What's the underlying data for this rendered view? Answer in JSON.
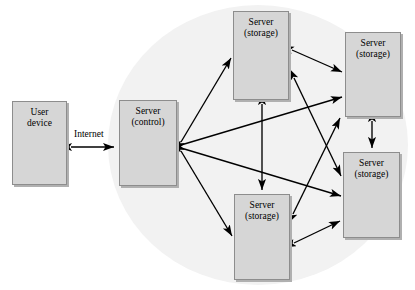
{
  "diagram": {
    "background_color": "#ffffff",
    "cloud_color": "#f2f2f2",
    "node_fill": "#d6d6d6",
    "node_border": "#8d8d8d",
    "node_shadow": "#b0b0b0",
    "arrow_color": "#000000",
    "nodes": [
      {
        "id": "user-device",
        "line1": "User",
        "line2": "device",
        "x": 12,
        "y": 101,
        "w": 55,
        "h": 84
      },
      {
        "id": "server-control",
        "line1": "Server",
        "line2": "(control)",
        "x": 119,
        "y": 100,
        "w": 58,
        "h": 86
      },
      {
        "id": "server-storage-top",
        "line1": "Server",
        "line2": "(storage)",
        "x": 233,
        "y": 11,
        "w": 56,
        "h": 89
      },
      {
        "id": "server-storage-right-top",
        "line1": "Server",
        "line2": "(storage)",
        "x": 345,
        "y": 32,
        "w": 56,
        "h": 85
      },
      {
        "id": "server-storage-right-bottom",
        "line1": "Server",
        "line2": "(storage)",
        "x": 343,
        "y": 152,
        "w": 57,
        "h": 86
      },
      {
        "id": "server-storage-bottom",
        "line1": "Server",
        "line2": "(storage)",
        "x": 234,
        "y": 194,
        "w": 56,
        "h": 86
      }
    ],
    "edge_labels": [
      {
        "id": "internet-label",
        "text": "Internet",
        "x": 74,
        "y": 129
      }
    ],
    "links": [
      {
        "from": "user-device",
        "to": "server-control",
        "type": "double"
      },
      {
        "from": "server-control",
        "to": "server-storage-top",
        "type": "double"
      },
      {
        "from": "server-control",
        "to": "server-storage-bottom",
        "type": "double"
      },
      {
        "from": "server-control",
        "to": "server-storage-right-top",
        "type": "double"
      },
      {
        "from": "server-control",
        "to": "server-storage-right-bottom",
        "type": "double"
      },
      {
        "from": "server-storage-top",
        "to": "server-storage-bottom",
        "type": "double"
      },
      {
        "from": "server-storage-top",
        "to": "server-storage-right-top",
        "type": "double"
      },
      {
        "from": "server-storage-top",
        "to": "server-storage-right-bottom",
        "type": "double"
      },
      {
        "from": "server-storage-bottom",
        "to": "server-storage-right-top",
        "type": "double"
      },
      {
        "from": "server-storage-bottom",
        "to": "server-storage-right-bottom",
        "type": "double"
      },
      {
        "from": "server-storage-right-top",
        "to": "server-storage-right-bottom",
        "type": "double"
      }
    ],
    "cloud": {
      "cx": 258,
      "cy": 145,
      "rx": 150,
      "ry": 140
    }
  }
}
